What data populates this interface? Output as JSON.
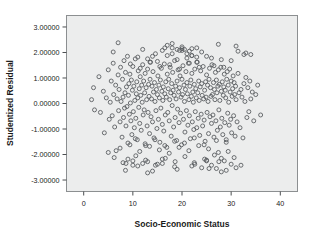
{
  "chart_data": {
    "type": "scatter",
    "title": "",
    "xlabel": "Socio-Economic Status",
    "ylabel": "Studentized Residual",
    "xlim": [
      -3.5,
      43.5
    ],
    "ylim": [
      -3.45,
      3.45
    ],
    "xticks": [
      0,
      10,
      20,
      30,
      40
    ],
    "xtick_labels": [
      "0",
      "10",
      "20",
      "30",
      "40"
    ],
    "yticks": [
      3,
      2,
      1,
      0,
      -1,
      -2,
      -3
    ],
    "ytick_labels": [
      "3.00000",
      "2.00000",
      "1.00000",
      "0.00000",
      "-1.00000",
      "-2.00000",
      "-3.00000"
    ],
    "grid": false,
    "legend": null,
    "marker": {
      "shape": "circle",
      "filled": false,
      "radius": 2.0,
      "edge_color": "#5b5f62"
    },
    "plot_background_color": "#eceded",
    "figure_background_color": "#ffffff",
    "axis_color": "#8c8f91",
    "n_points": 420,
    "x": [
      1.6,
      2.2,
      2.0,
      3.1,
      3.4,
      4.0,
      4.2,
      4.6,
      5.0,
      5.2,
      5.4,
      5.6,
      5.8,
      6.0,
      6.1,
      6.3,
      6.5,
      6.6,
      6.8,
      7.0,
      7.1,
      7.2,
      7.4,
      7.5,
      7.6,
      7.8,
      7.9,
      8.0,
      8.1,
      8.2,
      8.3,
      8.4,
      8.5,
      8.6,
      8.7,
      8.8,
      8.9,
      9.0,
      9.1,
      9.2,
      9.3,
      9.4,
      9.5,
      9.6,
      9.7,
      9.8,
      9.9,
      10.0,
      10.1,
      10.2,
      10.3,
      10.4,
      10.5,
      10.6,
      10.7,
      10.8,
      10.9,
      11.0,
      11.1,
      11.2,
      11.3,
      11.4,
      11.5,
      11.6,
      11.7,
      11.8,
      11.9,
      12.0,
      12.1,
      12.2,
      12.3,
      12.4,
      12.5,
      12.6,
      12.7,
      12.8,
      12.9,
      13.0,
      13.1,
      13.2,
      13.3,
      13.4,
      13.5,
      13.6,
      13.7,
      13.8,
      13.9,
      14.0,
      14.1,
      14.2,
      14.3,
      14.4,
      14.5,
      14.6,
      14.7,
      14.8,
      14.9,
      15.0,
      15.1,
      15.2,
      15.3,
      15.4,
      15.5,
      15.6,
      15.7,
      15.8,
      15.9,
      16.0,
      16.1,
      16.2,
      16.3,
      16.4,
      16.5,
      16.6,
      16.7,
      16.8,
      16.9,
      17.0,
      17.1,
      17.2,
      17.3,
      17.4,
      17.5,
      17.6,
      17.7,
      17.8,
      17.9,
      18.0,
      18.1,
      18.2,
      18.3,
      18.4,
      18.5,
      18.6,
      18.7,
      18.8,
      18.9,
      19.0,
      19.1,
      19.2,
      19.3,
      19.4,
      19.5,
      19.6,
      19.7,
      19.8,
      19.9,
      20.0,
      20.1,
      20.2,
      20.3,
      20.4,
      20.5,
      20.6,
      20.7,
      20.8,
      20.9,
      21.0,
      21.1,
      21.2,
      21.3,
      21.4,
      21.5,
      21.6,
      21.7,
      21.8,
      21.9,
      22.0,
      22.1,
      22.2,
      22.3,
      22.4,
      22.5,
      22.6,
      22.7,
      22.8,
      22.9,
      23.0,
      23.1,
      23.2,
      23.3,
      23.4,
      23.5,
      23.6,
      23.7,
      23.8,
      23.9,
      24.0,
      24.1,
      24.2,
      24.3,
      24.4,
      24.5,
      24.6,
      24.7,
      24.8,
      24.9,
      25.0,
      25.1,
      25.2,
      25.3,
      25.4,
      25.5,
      25.6,
      25.7,
      25.8,
      25.9,
      26.0,
      26.1,
      26.2,
      26.3,
      26.4,
      26.5,
      26.6,
      26.7,
      26.8,
      26.9,
      27.0,
      27.1,
      27.2,
      27.3,
      27.4,
      27.5,
      27.6,
      27.7,
      27.8,
      27.9,
      28.0,
      28.1,
      28.2,
      28.3,
      28.4,
      28.5,
      28.6,
      28.7,
      28.8,
      28.9,
      29.0,
      29.1,
      29.2,
      29.3,
      29.4,
      29.5,
      29.6,
      29.7,
      29.8,
      29.9,
      30.0,
      30.1,
      30.2,
      30.3,
      30.4,
      30.5,
      30.6,
      30.7,
      30.8,
      30.9,
      31.0,
      31.2,
      31.4,
      31.6,
      31.8,
      32.0,
      32.2,
      32.4,
      32.6,
      32.8,
      33.0,
      33.2,
      33.4,
      33.6,
      33.8,
      34.0,
      34.3,
      34.6,
      35.0,
      35.4,
      36.0,
      27.4,
      16.5,
      5.0,
      6.2,
      7.4,
      8.6,
      9.4,
      10.6,
      11.4,
      12.6,
      13.4,
      14.6,
      15.4,
      16.6,
      17.4,
      18.6,
      19.4,
      20.6,
      21.4,
      22.6,
      23.4,
      24.6,
      25.4,
      26.6,
      27.4,
      28.6,
      29.4,
      30.6,
      31.4,
      32.6,
      12.0,
      14.0,
      16.0,
      18.0,
      20.0,
      22.0,
      24.0,
      26.0,
      28.0,
      30.0,
      11.0,
      13.0,
      15.0,
      17.0,
      19.0,
      21.0,
      23.0,
      25.0,
      27.0,
      29.0,
      10.5,
      12.5,
      14.5,
      16.5,
      18.5,
      20.5,
      22.5,
      24.5,
      26.5,
      28.5,
      9.5,
      11.5,
      13.5,
      15.5,
      17.5,
      19.5,
      21.5,
      23.5,
      25.5,
      27.5,
      8.5,
      10.0,
      13.0,
      16.0,
      19.0,
      22.0,
      25.0,
      28.0,
      31.0,
      20.0,
      18.0,
      22.0,
      17.0,
      23.0,
      19.5,
      20.5,
      21.5,
      18.5,
      22.5,
      16.0,
      24.0,
      15.0,
      25.0,
      14.0,
      26.0,
      13.0,
      27.0,
      12.0,
      28.0,
      11.0,
      29.0,
      10.0,
      30.0,
      9.0,
      31.0,
      8.0,
      32.0,
      7.0,
      33.0,
      6.0,
      34.0,
      20.0,
      21.0,
      19.0,
      22.0,
      18.0,
      23.0,
      17.0,
      24.0,
      16.0,
      25.0
    ],
    "y": [
      0.15,
      -0.25,
      0.62,
      1.05,
      -0.35,
      0.48,
      -1.15,
      0.22,
      1.32,
      -0.62,
      0.05,
      0.88,
      -0.48,
      1.58,
      0.35,
      -0.92,
      0.72,
      -1.85,
      0.18,
      1.12,
      -0.28,
      0.55,
      -0.72,
      1.42,
      0.08,
      -1.32,
      0.95,
      0.25,
      -0.55,
      1.68,
      -0.18,
      0.42,
      1.22,
      -0.88,
      0.65,
      -0.12,
      1.85,
      -1.55,
      0.32,
      0.78,
      -0.42,
      1.15,
      0.02,
      -0.68,
      0.92,
      -1.22,
      0.52,
      1.45,
      -0.32,
      0.68,
      -0.95,
      0.12,
      1.75,
      -0.58,
      0.38,
      0.85,
      -1.42,
      0.22,
      1.28,
      -0.15,
      0.58,
      -0.78,
      1.05,
      0.32,
      -1.05,
      0.72,
      0.05,
      1.52,
      -0.45,
      0.88,
      -0.25,
      0.42,
      1.18,
      -1.65,
      0.62,
      0.15,
      -0.88,
      1.35,
      -0.35,
      0.75,
      0.28,
      -1.18,
      0.95,
      1.62,
      -0.52,
      0.18,
      0.68,
      -0.72,
      1.25,
      0.45,
      -1.35,
      0.82,
      0.08,
      1.95,
      -0.28,
      0.55,
      -0.98,
      0.35,
      1.08,
      -0.62,
      0.72,
      0.22,
      -1.52,
      0.92,
      -0.18,
      1.38,
      0.48,
      -0.82,
      0.12,
      0.65,
      -1.08,
      1.55,
      0.38,
      -0.45,
      0.85,
      0.25,
      -1.72,
      1.15,
      -0.35,
      0.58,
      0.95,
      -0.68,
      0.15,
      1.42,
      0.42,
      -1.28,
      0.78,
      -0.08,
      1.22,
      0.52,
      -0.92,
      0.32,
      1.68,
      -0.55,
      0.68,
      0.18,
      -1.45,
      0.88,
      -0.22,
      1.32,
      0.45,
      -0.75,
      0.62,
      1.08,
      -0.38,
      0.25,
      -1.62,
      0.95,
      0.35,
      1.48,
      -0.62,
      0.72,
      0.08,
      -1.12,
      0.55,
      1.25,
      -0.28,
      0.82,
      0.38,
      -0.85,
      1.58,
      0.15,
      -0.48,
      0.68,
      -1.38,
      0.92,
      0.28,
      1.18,
      -0.72,
      0.45,
      0.05,
      -1.02,
      0.75,
      1.35,
      -0.32,
      0.58,
      0.22,
      -0.95,
      1.62,
      0.42,
      -0.58,
      0.88,
      0.12,
      -1.25,
      0.65,
      1.28,
      -0.42,
      0.78,
      0.32,
      -0.88,
      1.45,
      0.18,
      -0.65,
      0.52,
      -1.48,
      0.85,
      0.25,
      1.12,
      -0.35,
      0.72,
      0.08,
      -1.18,
      0.95,
      1.38,
      -0.52,
      0.62,
      0.28,
      -0.78,
      1.52,
      0.35,
      -0.45,
      0.82,
      -1.32,
      0.55,
      0.15,
      1.22,
      -0.68,
      0.92,
      0.42,
      -1.05,
      0.68,
      1.32,
      -0.25,
      0.75,
      0.12,
      -0.92,
      1.42,
      0.48,
      -0.58,
      0.85,
      -1.22,
      0.32,
      0.65,
      1.15,
      -0.75,
      0.52,
      0.22,
      -1.42,
      0.95,
      1.25,
      -0.38,
      0.72,
      0.05,
      -0.85,
      1.35,
      0.45,
      -0.62,
      0.88,
      -1.15,
      0.28,
      0.58,
      1.08,
      -0.48,
      0.82,
      0.35,
      -1.28,
      0.68,
      0.15,
      -0.72,
      1.18,
      0.42,
      -0.95,
      0.55,
      0.25,
      -1.35,
      0.78,
      0.08,
      1.02,
      -0.55,
      0.62,
      -0.32,
      0.88,
      0.18,
      0.45,
      -0.68,
      0.35,
      0.72,
      -0.45,
      2.32,
      2.18,
      -1.92,
      -2.12,
      -1.75,
      -2.35,
      -1.62,
      -2.05,
      -1.88,
      -2.22,
      -1.68,
      -2.42,
      -1.82,
      -2.15,
      -1.95,
      -2.28,
      -1.72,
      -2.08,
      -1.85,
      -2.38,
      -1.65,
      -2.18,
      -1.78,
      -2.02,
      -1.92,
      -2.25,
      -1.88,
      -2.12,
      2.05,
      1.92,
      2.12,
      1.85,
      2.08,
      1.95,
      2.15,
      1.88,
      2.02,
      1.78,
      1.72,
      1.68,
      1.82,
      1.75,
      1.65,
      1.88,
      1.72,
      1.78,
      1.62,
      1.85,
      -1.45,
      -1.52,
      -1.38,
      -1.58,
      -1.42,
      -1.65,
      -1.48,
      -1.55,
      -1.35,
      -1.62,
      1.48,
      1.42,
      1.55,
      1.38,
      1.62,
      1.45,
      1.52,
      1.35,
      1.58,
      1.42,
      -2.55,
      -2.28,
      -2.62,
      -2.42,
      -2.72,
      -2.35,
      -2.58,
      -2.45,
      -2.25,
      -2.68,
      2.25,
      2.22,
      2.35,
      2.15,
      2.28,
      2.18,
      2.08,
      2.12,
      2.05,
      -2.48,
      -2.32,
      -2.18,
      -2.52,
      -2.38,
      -2.22,
      -2.65,
      -2.42,
      -2.28,
      -2.55,
      -2.35,
      -2.15,
      -2.45,
      -2.62,
      -2.25,
      -2.38,
      -2.18,
      -2.52,
      -2.32,
      -2.42,
      2.38,
      1.98,
      2.02,
      1.92,
      2.08,
      1.95,
      2.12,
      1.88,
      2.18,
      1.82
    ]
  },
  "accessibility": {
    "description": "Scatter plot of studentized residuals versus socio-economic status"
  }
}
